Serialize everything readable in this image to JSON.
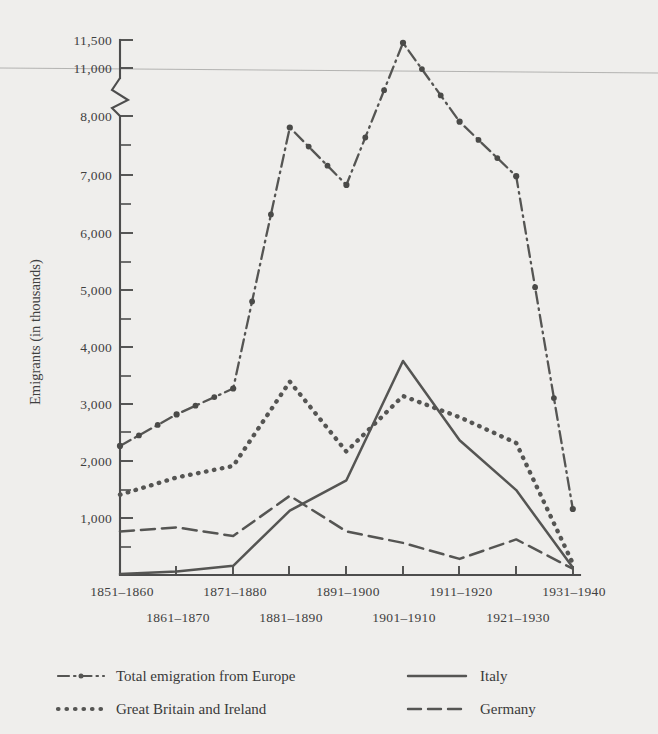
{
  "figure": {
    "y_axis_title": "Emigrants (in thousands)",
    "background_color": "#efeeec",
    "ink_color": "#4d4d4d"
  },
  "axes": {
    "y_tick_labels": [
      "11,500",
      "11,000",
      "8,000",
      "7,000",
      "6,000",
      "5,000",
      "4,000",
      "3,000",
      "2,000",
      "1,000"
    ],
    "y_axis_break": true,
    "y_break_between": [
      "11,000",
      "8,000"
    ],
    "x_tick_labels": [
      "1851–1860",
      "1861–1870",
      "1871–1880",
      "1881–1890",
      "1891–1900",
      "1901–1910",
      "1911–1920",
      "1921–1930",
      "1931–1940"
    ]
  },
  "legend": {
    "position": "below-plot",
    "entries": [
      {
        "label": "Total emigration from Europe",
        "style": "dash-dot",
        "color": "#555553"
      },
      {
        "label": "Great Britain and Ireland",
        "style": "dotted",
        "color": "#555553"
      },
      {
        "label": "Italy",
        "style": "solid",
        "color": "#555553"
      },
      {
        "label": "Germany",
        "style": "dashed",
        "color": "#555553"
      }
    ]
  },
  "chart_data": {
    "type": "line",
    "title": "",
    "subtitle": "",
    "xlabel": "",
    "ylabel": "Emigrants (in thousands)",
    "ylim": [
      0,
      11500
    ],
    "y_broken_axis": {
      "lower_max": 8000,
      "upper_min": 11000,
      "upper_max": 11500
    },
    "grid": false,
    "legend_position": "below-plot",
    "categories": [
      "1851–1860",
      "1861–1870",
      "1871–1880",
      "1881–1890",
      "1891–1900",
      "1901–1910",
      "1911–1920",
      "1921–1930",
      "1931–1940"
    ],
    "series": [
      {
        "name": "Total emigration from Europe",
        "style": "dash-dot",
        "markers": true,
        "values": [
          2250,
          2800,
          3250,
          7800,
          6800,
          11450,
          7900,
          6950,
          1150
        ]
      },
      {
        "name": "Great Britain and Ireland",
        "style": "dotted",
        "markers": false,
        "values": [
          1400,
          1700,
          1900,
          3370,
          2150,
          3120,
          2750,
          2300,
          200
        ]
      },
      {
        "name": "Italy",
        "style": "solid",
        "markers": false,
        "values": [
          20,
          60,
          160,
          1120,
          1650,
          3730,
          2350,
          1480,
          130
        ]
      },
      {
        "name": "Germany",
        "style": "dashed",
        "markers": false,
        "values": [
          760,
          830,
          680,
          1380,
          760,
          560,
          280,
          620,
          110
        ]
      }
    ]
  }
}
